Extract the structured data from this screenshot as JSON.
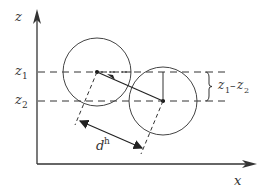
{
  "diagram": {
    "axes": {
      "z_label": "z",
      "x_label": "x"
    },
    "levels": {
      "z1": {
        "symbol": "z",
        "subscript": "1"
      },
      "z2": {
        "symbol": "z",
        "subscript": "2"
      }
    },
    "height_difference_label": {
      "z1": "z",
      "s1": "1",
      "dash": "–",
      "z2": "z",
      "s2": "2"
    },
    "distance_label": {
      "symbol": "d",
      "superscript": "h"
    },
    "colors": {
      "stroke": "#333333",
      "background": "#ffffff"
    }
  }
}
